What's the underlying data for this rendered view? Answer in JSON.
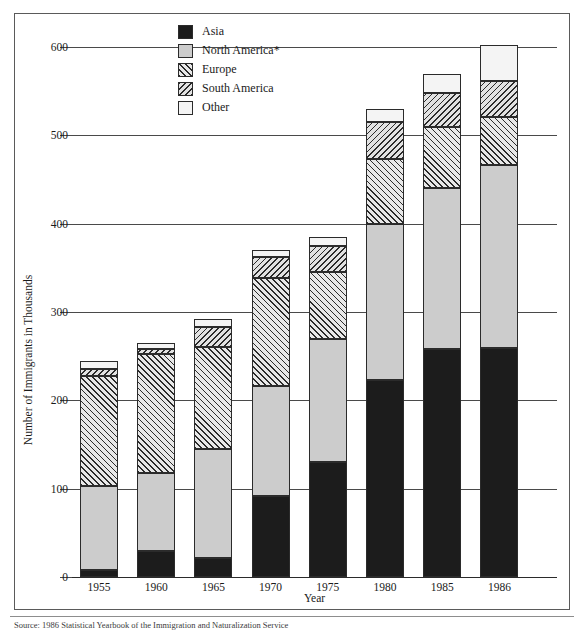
{
  "chart_data": {
    "type": "bar",
    "title": "",
    "subtitle": "",
    "stacked": true,
    "xlabel": "Year",
    "ylabel": "Number of Immigrants in Thousands",
    "categories": [
      "1955",
      "1960",
      "1965",
      "1970",
      "1975",
      "1980",
      "1985",
      "1986"
    ],
    "ylim": [
      0,
      600
    ],
    "yticks": [
      0,
      100,
      200,
      300,
      400,
      500,
      600
    ],
    "ytick_labels": [
      "0",
      "100",
      "200",
      "300",
      "400",
      "500",
      "600"
    ],
    "grid": "horizontal",
    "legend_position": "top-center",
    "series": [
      {
        "name": "Asia",
        "fill": "solid-black",
        "color": "#1c1c1c",
        "values": [
          8,
          30,
          21,
          92,
          130,
          223,
          258,
          259
        ]
      },
      {
        "name": "North America*",
        "fill": "solid-light-gray",
        "color": "#cccccc",
        "values": [
          95,
          88,
          124,
          124,
          140,
          177,
          182,
          207
        ]
      },
      {
        "name": "Europe",
        "fill": "diagonal-hatch-up",
        "color": "#e8e8e8",
        "values": [
          125,
          134,
          115,
          122,
          75,
          73,
          70,
          55
        ]
      },
      {
        "name": "South America",
        "fill": "diagonal-hatch-down",
        "color": "#e2e2e2",
        "values": [
          8,
          6,
          23,
          24,
          30,
          42,
          38,
          40
        ]
      },
      {
        "name": "Other",
        "fill": "solid-white",
        "color": "#f4f4f4",
        "values": [
          8,
          7,
          9,
          8,
          10,
          15,
          22,
          41
        ]
      }
    ],
    "totals": [
      244,
      265,
      292,
      370,
      385,
      530,
      570,
      602
    ],
    "annotations": []
  },
  "legend": {
    "items": [
      {
        "label": "Asia",
        "swatch": "solid-black"
      },
      {
        "label": "North America*",
        "swatch": "solid-light-gray"
      },
      {
        "label": "Europe",
        "swatch": "diagonal-hatch-up"
      },
      {
        "label": "South America",
        "swatch": "diagonal-hatch-down"
      },
      {
        "label": "Other",
        "swatch": "solid-white"
      }
    ]
  },
  "axes": {
    "y_title": "Number of Immigrants in Thousands",
    "x_title": "Year"
  },
  "footer": {
    "source": "Source: 1986 Statistical Yearbook of the Immigration and Naturalization Service"
  },
  "colors": {
    "asia": "#1c1c1c",
    "north_america": "#cccccc",
    "europe": "#e8e8e8",
    "south_america": "#e2e2e2",
    "other": "#f4f4f4",
    "axis": "#2b2b2b",
    "grid": "#4a4a4a"
  }
}
